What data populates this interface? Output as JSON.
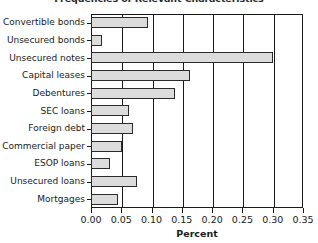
{
  "chart_data": {
    "type": "bar",
    "orientation": "horizontal",
    "title": "Frequencies of Relevant Characteristics",
    "xlabel": "Percent",
    "ylabel": "",
    "xlim": [
      0.0,
      0.35
    ],
    "ylim": null,
    "grid": true,
    "legend": null,
    "categories": [
      "Convertible bonds",
      "Unsecured bonds",
      "Unsecured notes",
      "Capital leases",
      "Debentures",
      "SEC loans",
      "Foreign debt",
      "Commercial paper",
      "ESOP loans",
      "Unsecured loans",
      "Mortgages"
    ],
    "values": [
      0.094,
      0.018,
      0.3,
      0.164,
      0.139,
      0.063,
      0.069,
      0.051,
      0.031,
      0.076,
      0.045
    ],
    "xticks": [
      0.0,
      0.05,
      0.1,
      0.15,
      0.2,
      0.25,
      0.3,
      0.35
    ],
    "xticklabels": [
      "0.00",
      "0.05",
      "0.10",
      "0.15",
      "0.20",
      "0.25",
      "0.30",
      "0.35"
    ],
    "bar_fill_color": "#dcdcdc",
    "bar_edge_color": "#2b2b2b",
    "axis_color": "#1a1a1a",
    "background_color": "#ffffff"
  }
}
